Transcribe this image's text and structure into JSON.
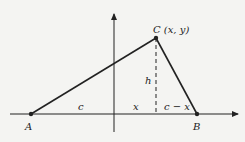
{
  "diagram": {
    "points": {
      "A": {
        "label": "A",
        "x": 31,
        "y": 114
      },
      "B": {
        "label": "B",
        "x": 197,
        "y": 114
      },
      "C": {
        "label": "C (x, y)",
        "x": 156,
        "y": 38
      }
    },
    "segment_labels": {
      "c": "c",
      "x": "x",
      "c_minus_x": "c − x",
      "h": "h"
    },
    "colors": {
      "line": "#222222",
      "background": "#f4f4f2"
    }
  }
}
